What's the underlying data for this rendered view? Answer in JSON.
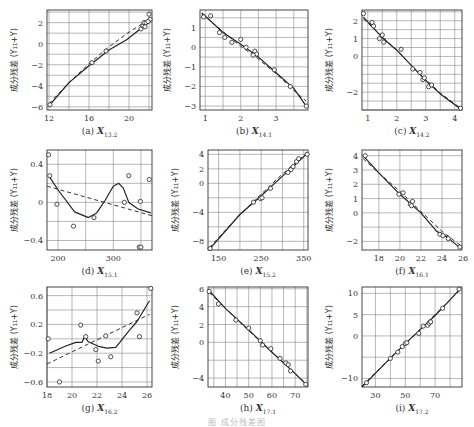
{
  "figure_caption": "图 成分残差图",
  "ylabel": "成分残差 (Y₁₁+Y)",
  "chart_data": [
    {
      "id": "a",
      "type": "scatter",
      "caption": "(a) X13.2",
      "var": "X",
      "sub": "13.2",
      "xlabel": "X13.2",
      "ylabel": "成分残差 (Y11+Y)",
      "xlim": [
        11.8,
        22.3
      ],
      "ylim": [
        -6.3,
        3.2
      ],
      "xticks": [
        12,
        16,
        20
      ],
      "yticks": [
        -6,
        -4,
        -2,
        0,
        2
      ],
      "xgrid": [
        12,
        14,
        16,
        18,
        20,
        22
      ],
      "ygrid": [
        -6,
        -5,
        -4,
        -3,
        -2,
        -1,
        0,
        1,
        2,
        3
      ],
      "points": [
        [
          12.1,
          -5.8
        ],
        [
          16.3,
          -1.8
        ],
        [
          17.7,
          -0.7
        ],
        [
          21.2,
          1.4
        ],
        [
          21.4,
          1.7
        ],
        [
          21.5,
          2.0
        ],
        [
          21.6,
          1.6
        ],
        [
          21.7,
          2.0
        ],
        [
          22.0,
          2.8
        ],
        [
          22.1,
          2.3
        ],
        [
          21.9,
          2.1
        ]
      ],
      "smooth": [
        [
          12.0,
          -5.9
        ],
        [
          14,
          -3.7
        ],
        [
          16,
          -2.1
        ],
        [
          18,
          -0.6
        ],
        [
          19.8,
          0.4
        ],
        [
          21,
          1.3
        ],
        [
          21.6,
          2.0
        ],
        [
          22.2,
          2.4
        ]
      ],
      "fit": [
        [
          12.0,
          -5.7
        ],
        [
          14,
          -3.7
        ],
        [
          16,
          -1.9
        ],
        [
          18,
          -0.3
        ],
        [
          20,
          1.1
        ],
        [
          22.2,
          2.4
        ]
      ]
    },
    {
      "id": "b",
      "type": "scatter",
      "caption": "(b) X14.1",
      "var": "X",
      "sub": "14.1",
      "xlabel": "X14.1",
      "ylabel": "成分残差 (Y11+Y)",
      "xlim": [
        0.85,
        3.9
      ],
      "ylim": [
        -3.2,
        1.9
      ],
      "xticks": [
        1.0,
        2.0,
        3.0
      ],
      "yticks": [
        -3,
        -2,
        -1,
        0,
        1
      ],
      "xgrid": [
        1.0,
        1.5,
        2.0,
        2.5,
        3.0,
        3.5
      ],
      "ygrid": [
        -3,
        -2.5,
        -2,
        -1.5,
        -1,
        -0.5,
        0,
        0.5,
        1,
        1.5
      ],
      "points": [
        [
          0.95,
          1.55
        ],
        [
          1.15,
          1.6
        ],
        [
          1.4,
          0.75
        ],
        [
          1.55,
          0.5
        ],
        [
          1.75,
          0.25
        ],
        [
          2.0,
          0.4
        ],
        [
          2.15,
          0.0
        ],
        [
          2.4,
          -0.2
        ],
        [
          2.45,
          -0.35
        ],
        [
          2.35,
          -0.4
        ],
        [
          2.95,
          -1.15
        ],
        [
          3.4,
          -2.0
        ],
        [
          3.85,
          -3.0
        ]
      ],
      "smooth": [
        [
          0.9,
          1.75
        ],
        [
          1.5,
          0.75
        ],
        [
          2.0,
          0.15
        ],
        [
          2.5,
          -0.5
        ],
        [
          3.0,
          -1.3
        ],
        [
          3.5,
          -2.1
        ],
        [
          3.85,
          -3.0
        ]
      ],
      "fit": [
        [
          0.9,
          1.7
        ],
        [
          1.5,
          0.8
        ],
        [
          2.0,
          0.05
        ],
        [
          2.5,
          -0.6
        ],
        [
          3.0,
          -1.35
        ],
        [
          3.5,
          -2.2
        ],
        [
          3.85,
          -2.75
        ]
      ]
    },
    {
      "id": "c",
      "type": "scatter",
      "caption": "(c) X14.2",
      "var": "X",
      "sub": "14.2",
      "xlabel": "X14.2",
      "ylabel": "成分残差 (Y11+Y)",
      "xlim": [
        0.8,
        4.25
      ],
      "ylim": [
        -3.0,
        2.6
      ],
      "xticks": [
        1.0,
        2.0,
        3.0,
        4.0
      ],
      "yticks": [
        -2,
        0,
        1,
        2
      ],
      "xgrid": [
        1.0,
        1.5,
        2.0,
        2.5,
        3.0,
        3.5,
        4.0
      ],
      "ygrid": [
        -3,
        -2.5,
        -2,
        -1.5,
        -1,
        -0.5,
        0,
        0.5,
        1,
        1.5,
        2,
        2.5
      ],
      "points": [
        [
          0.85,
          2.4
        ],
        [
          1.15,
          1.9
        ],
        [
          1.2,
          1.7
        ],
        [
          1.4,
          1.0
        ],
        [
          1.5,
          1.2
        ],
        [
          1.55,
          0.8
        ],
        [
          2.15,
          0.4
        ],
        [
          2.55,
          -0.7
        ],
        [
          2.8,
          -0.9
        ],
        [
          2.9,
          -1.3
        ],
        [
          2.95,
          -1.2
        ],
        [
          3.1,
          -1.7
        ],
        [
          3.2,
          -1.6
        ],
        [
          4.2,
          -2.9
        ]
      ],
      "smooth": [
        [
          0.85,
          2.2
        ],
        [
          1.5,
          1.05
        ],
        [
          2.0,
          0.35
        ],
        [
          2.5,
          -0.5
        ],
        [
          3.0,
          -1.35
        ],
        [
          3.5,
          -2.1
        ],
        [
          4.2,
          -2.95
        ]
      ],
      "fit": [
        [
          0.85,
          2.1
        ],
        [
          1.5,
          1.1
        ],
        [
          2.0,
          0.35
        ],
        [
          2.5,
          -0.5
        ],
        [
          3.0,
          -1.3
        ],
        [
          3.5,
          -2.05
        ],
        [
          4.2,
          -2.9
        ]
      ]
    },
    {
      "id": "d",
      "type": "scatter",
      "caption": "(d) X15.1",
      "var": "X",
      "sub": "15.1",
      "xlabel": "X15.1",
      "ylabel": "成分残差 (Y11+Y)",
      "xlim": [
        180,
        370
      ],
      "ylim": [
        -0.5,
        0.55
      ],
      "xticks": [
        200,
        300
      ],
      "yticks": [
        -0.4,
        0.0,
        0.4
      ],
      "xgrid": [
        200,
        250,
        300,
        350
      ],
      "ygrid": [
        -0.4,
        -0.2,
        0.0,
        0.2,
        0.4
      ],
      "points": [
        [
          183,
          0.5
        ],
        [
          185,
          0.28
        ],
        [
          198,
          -0.02
        ],
        [
          228,
          -0.25
        ],
        [
          265,
          -0.16
        ],
        [
          320,
          0.0
        ],
        [
          328,
          0.28
        ],
        [
          347,
          -0.47
        ],
        [
          350,
          -0.47
        ],
        [
          349,
          0.01
        ],
        [
          365,
          0.24
        ]
      ],
      "smooth": [
        [
          183,
          0.28
        ],
        [
          200,
          0.13
        ],
        [
          230,
          -0.1
        ],
        [
          255,
          -0.16
        ],
        [
          270,
          -0.11
        ],
        [
          285,
          0.02
        ],
        [
          300,
          0.17
        ],
        [
          310,
          0.2
        ],
        [
          318,
          0.15
        ],
        [
          328,
          0.0
        ],
        [
          345,
          -0.07
        ],
        [
          368,
          -0.11
        ]
      ],
      "fit": [
        [
          180,
          0.17
        ],
        [
          370,
          -0.14
        ]
      ]
    },
    {
      "id": "e",
      "type": "scatter",
      "caption": "(e) X15.2",
      "var": "X",
      "sub": "15.2",
      "xlabel": "X15.2",
      "ylabel": "成分残差 (Y11+Y)",
      "xlim": [
        125,
        360
      ],
      "ylim": [
        -9.2,
        4.6
      ],
      "xticks": [
        150,
        250,
        350
      ],
      "yticks": [
        -8,
        -4,
        0,
        2,
        4
      ],
      "xgrid": [
        150,
        200,
        250,
        300,
        350
      ],
      "ygrid": [
        -8,
        -6,
        -4,
        -2,
        0,
        2,
        4
      ],
      "points": [
        [
          130,
          -9.0
        ],
        [
          232,
          -2.6
        ],
        [
          248,
          -2.1
        ],
        [
          252,
          -2.0
        ],
        [
          272,
          -0.7
        ],
        [
          313,
          1.5
        ],
        [
          320,
          1.9
        ],
        [
          325,
          2.3
        ],
        [
          333,
          3.0
        ],
        [
          338,
          3.4
        ],
        [
          358,
          4.0
        ]
      ],
      "smooth": [
        [
          128,
          -9.1
        ],
        [
          200,
          -4.3
        ],
        [
          250,
          -1.7
        ],
        [
          300,
          1.0
        ],
        [
          330,
          2.6
        ],
        [
          358,
          4.1
        ]
      ],
      "fit": [
        [
          128,
          -8.9
        ],
        [
          200,
          -4.3
        ],
        [
          250,
          -1.5
        ],
        [
          300,
          1.3
        ],
        [
          358,
          4.2
        ]
      ]
    },
    {
      "id": "f",
      "type": "scatter",
      "caption": "(f) X16.1",
      "var": "X",
      "sub": "16.1",
      "xlabel": "X16.1",
      "ylabel": "成分残差 (Y11+Y)",
      "xlim": [
        16.4,
        25.9
      ],
      "ylim": [
        -2.6,
        4.4
      ],
      "xticks": [
        18,
        20,
        22,
        24,
        26
      ],
      "yticks": [
        -2,
        0,
        1,
        2,
        3,
        4
      ],
      "xgrid": [
        18,
        20,
        22,
        24
      ],
      "ygrid": [
        -2,
        -1,
        0,
        1,
        2,
        3,
        4
      ],
      "points": [
        [
          16.7,
          4.0
        ],
        [
          19.9,
          1.3
        ],
        [
          20.3,
          1.4
        ],
        [
          21.0,
          0.6
        ],
        [
          21.2,
          0.8
        ],
        [
          21.1,
          0.5
        ],
        [
          23.8,
          -1.5
        ],
        [
          24.1,
          -1.6
        ],
        [
          24.6,
          -1.8
        ],
        [
          25.7,
          -2.4
        ]
      ],
      "smooth": [
        [
          16.5,
          4.0
        ],
        [
          18,
          2.8
        ],
        [
          20,
          1.3
        ],
        [
          22,
          0.0
        ],
        [
          23.5,
          -1.3
        ],
        [
          24.5,
          -1.7
        ],
        [
          25.8,
          -2.5
        ]
      ],
      "fit": [
        [
          16.5,
          3.8
        ],
        [
          18,
          2.8
        ],
        [
          20,
          1.5
        ],
        [
          22,
          0.1
        ],
        [
          24,
          -1.3
        ],
        [
          25.8,
          -2.3
        ]
      ]
    },
    {
      "id": "g",
      "type": "scatter",
      "caption": "(g) X16.2",
      "var": "X",
      "sub": "16.2",
      "xlabel": "X16.2",
      "ylabel": "成分残差 (Y11+Y)",
      "xlim": [
        18,
        26.4
      ],
      "ylim": [
        -0.67,
        0.72
      ],
      "xticks": [
        18,
        20,
        22,
        24,
        26
      ],
      "yticks": [
        -0.6,
        -0.2,
        0.2,
        0.6
      ],
      "xgrid": [
        18,
        20,
        22,
        24,
        26
      ],
      "ygrid": [
        -0.6,
        -0.4,
        -0.2,
        0.0,
        0.2,
        0.4,
        0.6
      ],
      "points": [
        [
          18.1,
          0.0
        ],
        [
          19.0,
          -0.6
        ],
        [
          20.7,
          0.19
        ],
        [
          21.1,
          0.03
        ],
        [
          21.9,
          -0.15
        ],
        [
          22.1,
          -0.31
        ],
        [
          22.7,
          0.04
        ],
        [
          23.1,
          -0.25
        ],
        [
          25.2,
          0.36
        ],
        [
          25.4,
          0.03
        ],
        [
          26.3,
          0.7
        ]
      ],
      "smooth": [
        [
          18.2,
          -0.2
        ],
        [
          19.5,
          -0.1
        ],
        [
          20.3,
          -0.05
        ],
        [
          20.8,
          -0.05
        ],
        [
          21.0,
          0.03
        ],
        [
          21.3,
          -0.04
        ],
        [
          22.2,
          -0.11
        ],
        [
          22.8,
          -0.13
        ],
        [
          23.5,
          -0.12
        ],
        [
          24.5,
          0.1
        ],
        [
          25.2,
          0.24
        ],
        [
          26.2,
          0.53
        ]
      ],
      "fit": [
        [
          18.0,
          -0.35
        ],
        [
          26.2,
          0.34
        ]
      ]
    },
    {
      "id": "h",
      "type": "scatter",
      "caption": "(h) X17.1",
      "var": "X",
      "sub": "17.1",
      "xlabel": "X17.1",
      "ylabel": "成分残差 (Y11+Y)",
      "xlim": [
        32.5,
        75.5
      ],
      "ylim": [
        -5.0,
        6.2
      ],
      "xticks": [
        40,
        50,
        60,
        70
      ],
      "yticks": [
        -4,
        0,
        2,
        4,
        6
      ],
      "xgrid": [
        35,
        40,
        45,
        50,
        55,
        60,
        65,
        70,
        75
      ],
      "ygrid": [
        -4,
        -2,
        0,
        2,
        4,
        6
      ],
      "points": [
        [
          33,
          5.7
        ],
        [
          37,
          4.3
        ],
        [
          44.5,
          2.5
        ],
        [
          50,
          1.6
        ],
        [
          55,
          0.2
        ],
        [
          56,
          -0.3
        ],
        [
          59.5,
          -0.7
        ],
        [
          63.5,
          -1.8
        ],
        [
          66,
          -2.3
        ],
        [
          67,
          -2.5
        ],
        [
          68,
          -3.2
        ],
        [
          74.5,
          -4.7
        ]
      ],
      "smooth": [
        [
          33,
          5.8
        ],
        [
          40,
          3.8
        ],
        [
          50,
          1.4
        ],
        [
          60,
          -1.1
        ],
        [
          70,
          -3.5
        ],
        [
          75,
          -4.8
        ]
      ],
      "fit": [
        [
          33,
          5.6
        ],
        [
          40,
          3.8
        ],
        [
          50,
          1.3
        ],
        [
          60,
          -1.1
        ],
        [
          70,
          -3.5
        ],
        [
          75,
          -4.7
        ]
      ]
    },
    {
      "id": "i",
      "type": "scatter",
      "caption": "(i) X17.2",
      "var": "X",
      "sub": "17.2",
      "xlabel": "X17.2",
      "ylabel": "成分残差 (Y11+Y)",
      "xlim": [
        21,
        88
      ],
      "ylim": [
        -12,
        11.5
      ],
      "xticks": [
        30,
        50,
        70
      ],
      "yticks": [
        -10,
        0,
        5,
        10
      ],
      "xgrid": [
        30,
        40,
        50,
        60,
        70,
        80
      ],
      "ygrid": [
        -10,
        -5,
        0,
        5,
        10
      ],
      "points": [
        [
          24,
          -11
        ],
        [
          40,
          -5.3
        ],
        [
          45,
          -3.8
        ],
        [
          48,
          -2.5
        ],
        [
          50,
          -1.8
        ],
        [
          51,
          -1.6
        ],
        [
          59,
          0.6
        ],
        [
          62,
          2.3
        ],
        [
          65,
          2.5
        ],
        [
          66,
          3.0
        ],
        [
          67,
          3.3
        ],
        [
          75,
          6.5
        ],
        [
          86,
          11
        ]
      ],
      "smooth": [
        [
          21,
          -12
        ],
        [
          30,
          -8.8
        ],
        [
          40,
          -5.2
        ],
        [
          50,
          -1.8
        ],
        [
          60,
          1.5
        ],
        [
          70,
          4.8
        ],
        [
          80,
          8.5
        ],
        [
          87,
          11.2
        ]
      ],
      "fit": [
        [
          21,
          -11.8
        ],
        [
          40,
          -5.2
        ],
        [
          60,
          1.6
        ],
        [
          87,
          10.9
        ]
      ]
    }
  ]
}
